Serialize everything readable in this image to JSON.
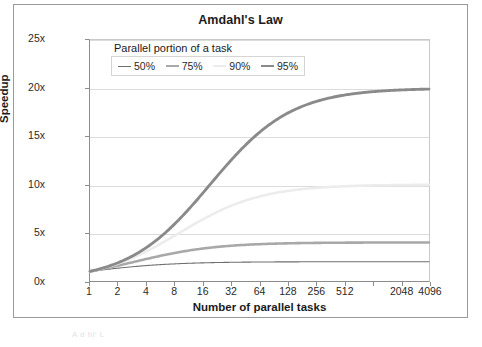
{
  "chart_data": {
    "type": "line",
    "title": "Amdahl's Law",
    "xlabel": "Number of parallel tasks",
    "ylabel": "Speedup",
    "x": [
      1,
      2,
      4,
      8,
      16,
      32,
      64,
      128,
      256,
      512,
      1024,
      2048,
      4096
    ],
    "xtick_labels": [
      "1",
      "2",
      "4",
      "8",
      "16",
      "32",
      "64",
      "128",
      "256",
      "512",
      "2048",
      "4096"
    ],
    "xscale": "log2",
    "xlim": [
      1,
      4096
    ],
    "ylim": [
      0,
      25
    ],
    "ytick_labels": [
      "0x",
      "5x",
      "10x",
      "15x",
      "20x",
      "25x"
    ],
    "ytick_values": [
      0,
      5,
      10,
      15,
      20,
      25
    ],
    "grid": "horizontal",
    "legend_title": "Parallel portion of a task",
    "legend_position": "top-left-inside",
    "formula": "S(n) = 1 / ((1 - p) + p/n)",
    "series": [
      {
        "name": "50%",
        "p": 0.5,
        "color": "#6f6f6f",
        "width": 1.1,
        "asymptote": 2,
        "values": [
          1,
          1.333,
          1.6,
          1.778,
          1.882,
          1.939,
          1.969,
          1.984,
          1.992,
          1.996,
          1.998,
          1.999,
          2.0
        ]
      },
      {
        "name": "75%",
        "p": 0.75,
        "color": "#a8a8a8",
        "width": 2.6,
        "asymptote": 4,
        "values": [
          1,
          1.6,
          2.286,
          2.909,
          3.368,
          3.657,
          3.822,
          3.908,
          3.953,
          3.977,
          3.988,
          3.994,
          3.997
        ]
      },
      {
        "name": "90%",
        "p": 0.9,
        "color": "#ececec",
        "width": 2.6,
        "asymptote": 10,
        "values": [
          1,
          1.818,
          3.077,
          4.706,
          6.4,
          7.805,
          8.767,
          9.346,
          9.662,
          9.828,
          9.913,
          9.956,
          9.978
        ]
      },
      {
        "name": "95%",
        "p": 0.95,
        "color": "#8a8a8a",
        "width": 2.9,
        "asymptote": 20,
        "values": [
          1,
          1.905,
          3.478,
          5.926,
          9.143,
          12.54,
          15.42,
          17.42,
          18.62,
          19.29,
          19.64,
          19.82,
          19.91
        ]
      }
    ]
  },
  "figure": {
    "title": "Amdahl's Law",
    "y_axis_title": "Speedup",
    "x_axis_title": "Number of parallel tasks",
    "legend_title": "Parallel portion of a task",
    "legend_labels": [
      "50%",
      "75%",
      "90%",
      "95%"
    ],
    "scan_artifact_text": "A  d  hl' L"
  }
}
